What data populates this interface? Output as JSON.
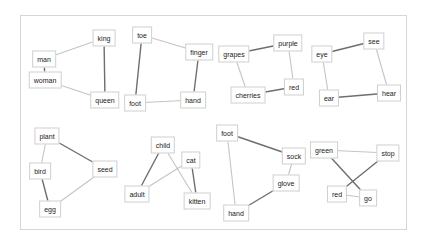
{
  "colors": {
    "edge_dark": "#6e6e6e",
    "edge_light": "#c4c4c4",
    "node_border": "#cfcfcf",
    "frame_border": "#d6d6d6"
  },
  "panels": [
    {
      "name": "royalty",
      "nodes": [
        {
          "id": "king",
          "label": "king",
          "x": 104,
          "y": 38
        },
        {
          "id": "man",
          "label": "man",
          "x": 44,
          "y": 59
        },
        {
          "id": "woman",
          "label": "woman",
          "x": 45,
          "y": 80
        },
        {
          "id": "queen",
          "label": "queen",
          "x": 105,
          "y": 100
        }
      ],
      "edges": [
        {
          "from": "man",
          "to": "king",
          "shade": "light"
        },
        {
          "from": "man",
          "to": "woman",
          "shade": "dark"
        },
        {
          "from": "woman",
          "to": "queen",
          "shade": "light"
        },
        {
          "from": "king",
          "to": "queen",
          "shade": "dark"
        }
      ]
    },
    {
      "name": "extremities",
      "nodes": [
        {
          "id": "toe",
          "label": "toe",
          "x": 142,
          "y": 35
        },
        {
          "id": "finger",
          "label": "finger",
          "x": 199,
          "y": 52
        },
        {
          "id": "foot",
          "label": "foot",
          "x": 135,
          "y": 103
        },
        {
          "id": "hand",
          "label": "hand",
          "x": 193,
          "y": 100
        }
      ],
      "edges": [
        {
          "from": "toe",
          "to": "finger",
          "shade": "light"
        },
        {
          "from": "toe",
          "to": "foot",
          "shade": "dark"
        },
        {
          "from": "finger",
          "to": "hand",
          "shade": "dark"
        },
        {
          "from": "foot",
          "to": "hand",
          "shade": "light"
        }
      ]
    },
    {
      "name": "fruit-colors",
      "nodes": [
        {
          "id": "grapes",
          "label": "grapes",
          "x": 234,
          "y": 54
        },
        {
          "id": "purple",
          "label": "purple",
          "x": 288,
          "y": 43
        },
        {
          "id": "red",
          "label": "red",
          "x": 294,
          "y": 87
        },
        {
          "id": "cherries",
          "label": "cherries",
          "x": 248,
          "y": 95
        }
      ],
      "edges": [
        {
          "from": "grapes",
          "to": "purple",
          "shade": "dark"
        },
        {
          "from": "grapes",
          "to": "cherries",
          "shade": "light"
        },
        {
          "from": "purple",
          "to": "red",
          "shade": "light"
        },
        {
          "from": "cherries",
          "to": "red",
          "shade": "dark"
        }
      ]
    },
    {
      "name": "senses",
      "nodes": [
        {
          "id": "eye",
          "label": "eye",
          "x": 322,
          "y": 54
        },
        {
          "id": "see",
          "label": "see",
          "x": 374,
          "y": 41
        },
        {
          "id": "ear",
          "label": "ear",
          "x": 329,
          "y": 98
        },
        {
          "id": "hear",
          "label": "hear",
          "x": 389,
          "y": 93
        }
      ],
      "edges": [
        {
          "from": "eye",
          "to": "see",
          "shade": "dark"
        },
        {
          "from": "eye",
          "to": "ear",
          "shade": "light"
        },
        {
          "from": "see",
          "to": "hear",
          "shade": "light"
        },
        {
          "from": "ear",
          "to": "hear",
          "shade": "dark"
        }
      ]
    },
    {
      "name": "origins",
      "nodes": [
        {
          "id": "plant",
          "label": "plant",
          "x": 47,
          "y": 136
        },
        {
          "id": "bird",
          "label": "bird",
          "x": 40,
          "y": 171
        },
        {
          "id": "seed",
          "label": "seed",
          "x": 105,
          "y": 169
        },
        {
          "id": "egg",
          "label": "egg",
          "x": 50,
          "y": 209
        }
      ],
      "edges": [
        {
          "from": "plant",
          "to": "bird",
          "shade": "light"
        },
        {
          "from": "plant",
          "to": "seed",
          "shade": "dark"
        },
        {
          "from": "bird",
          "to": "egg",
          "shade": "dark"
        },
        {
          "from": "seed",
          "to": "egg",
          "shade": "light"
        }
      ]
    },
    {
      "name": "young-adult",
      "nodes": [
        {
          "id": "child",
          "label": "child",
          "x": 163,
          "y": 145
        },
        {
          "id": "cat",
          "label": "cat",
          "x": 191,
          "y": 160
        },
        {
          "id": "adult",
          "label": "adult",
          "x": 137,
          "y": 194
        },
        {
          "id": "kitten",
          "label": "kitten",
          "x": 197,
          "y": 201
        }
      ],
      "edges": [
        {
          "from": "child",
          "to": "adult",
          "shade": "dark"
        },
        {
          "from": "child",
          "to": "kitten",
          "shade": "light"
        },
        {
          "from": "cat",
          "to": "adult",
          "shade": "light"
        },
        {
          "from": "cat",
          "to": "kitten",
          "shade": "dark"
        }
      ]
    },
    {
      "name": "clothing",
      "nodes": [
        {
          "id": "foot2",
          "label": "foot",
          "x": 227,
          "y": 133
        },
        {
          "id": "sock",
          "label": "sock",
          "x": 294,
          "y": 156
        },
        {
          "id": "glove",
          "label": "glove",
          "x": 286,
          "y": 183
        },
        {
          "id": "hand2",
          "label": "hand",
          "x": 236,
          "y": 213
        }
      ],
      "edges": [
        {
          "from": "foot2",
          "to": "sock",
          "shade": "dark"
        },
        {
          "from": "foot2",
          "to": "hand2",
          "shade": "light"
        },
        {
          "from": "sock",
          "to": "glove",
          "shade": "light"
        },
        {
          "from": "glove",
          "to": "hand2",
          "shade": "dark"
        }
      ]
    },
    {
      "name": "traffic",
      "nodes": [
        {
          "id": "green",
          "label": "green",
          "x": 324,
          "y": 150
        },
        {
          "id": "stop",
          "label": "stop",
          "x": 388,
          "y": 153
        },
        {
          "id": "red2",
          "label": "red",
          "x": 337,
          "y": 194
        },
        {
          "id": "go",
          "label": "go",
          "x": 368,
          "y": 198
        }
      ],
      "edges": [
        {
          "from": "green",
          "to": "stop",
          "shade": "light"
        },
        {
          "from": "green",
          "to": "go",
          "shade": "dark"
        },
        {
          "from": "stop",
          "to": "red2",
          "shade": "dark"
        },
        {
          "from": "red2",
          "to": "go",
          "shade": "light"
        }
      ]
    }
  ]
}
